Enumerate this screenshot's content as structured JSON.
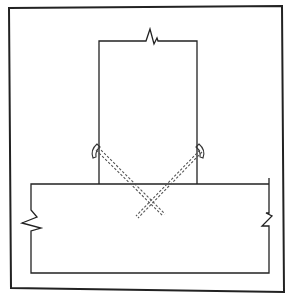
{
  "diagram": {
    "title": "",
    "colors": {
      "background": "#ffffff",
      "line": "#222222",
      "hidden_line": "#555555"
    },
    "parts": [
      {
        "id": "frame",
        "label": "",
        "type": "outer-border"
      },
      {
        "id": "stud",
        "label": "",
        "type": "vertical-member",
        "break": "top"
      },
      {
        "id": "plate",
        "label": "",
        "type": "horizontal-member",
        "break": "left-and-right"
      },
      {
        "id": "nail-left",
        "label": "",
        "type": "nail",
        "direction": "down-right"
      },
      {
        "id": "nail-right",
        "label": "",
        "type": "nail",
        "direction": "down-left"
      }
    ]
  }
}
